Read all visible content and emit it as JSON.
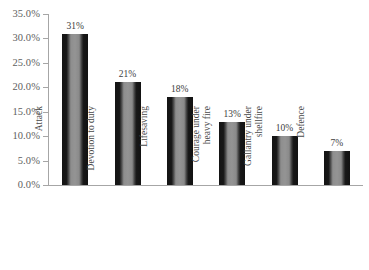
{
  "chart_data": {
    "type": "bar",
    "title": "",
    "xlabel": "",
    "ylabel": "",
    "ylim": [
      0,
      35
    ],
    "grid": false,
    "legend": false,
    "categories": [
      "Attack",
      "Devotion to duty",
      "Lifesaving",
      "Courage under heavy fire",
      "Gallantry under shellfire",
      "Defence"
    ],
    "category_lines": [
      [
        "Attack"
      ],
      [
        "Devotion to duty"
      ],
      [
        "Lifesaving"
      ],
      [
        "Courage under",
        "heavy fire"
      ],
      [
        "Gallantry under",
        "shellfire"
      ],
      [
        "Defence"
      ]
    ],
    "values": [
      31,
      21,
      18,
      13,
      10,
      7
    ],
    "data_labels": [
      "31%",
      "21%",
      "18%",
      "13%",
      "10%",
      "7%"
    ],
    "y_ticks": [
      0,
      5,
      10,
      15,
      20,
      25,
      30,
      35
    ],
    "y_tick_labels": [
      "35.0%",
      "30.0%",
      "25.0%",
      "20.0%",
      "15.0%",
      "10.0%",
      "5.0%",
      "0.0%"
    ],
    "colors": {
      "bar_edge": "#141414",
      "bar_center": "#949494",
      "axis": "#a6a6a6",
      "tick_text": "#5e5e5e",
      "label_text": "#4a4a4a",
      "value_text": "#3d3d3d",
      "background": "#ffffff"
    }
  }
}
